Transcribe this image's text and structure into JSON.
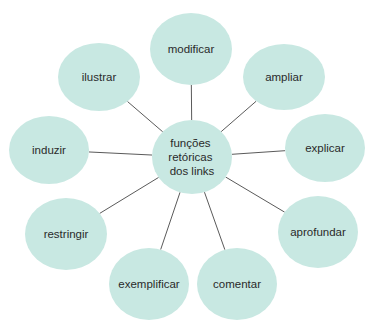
{
  "diagram": {
    "type": "radial-mind-map",
    "colors": {
      "bubble_fill": "#c8e8e2",
      "connector_line": "#5a5a5a",
      "text": "#2a2a2a",
      "background": "#ffffff"
    },
    "center": {
      "label_lines": [
        "funções",
        "retóricas",
        "dos links"
      ],
      "cx": 192,
      "cy": 157,
      "rx": 40,
      "ry": 37
    },
    "nodes": [
      {
        "label": "modificar",
        "cx": 191,
        "cy": 49,
        "rx": 41,
        "ry": 36
      },
      {
        "label": "ampliar",
        "cx": 284,
        "cy": 77,
        "rx": 41,
        "ry": 33
      },
      {
        "label": "explicar",
        "cx": 325,
        "cy": 148,
        "rx": 40,
        "ry": 34
      },
      {
        "label": "aprofundar",
        "cx": 318,
        "cy": 232,
        "rx": 40,
        "ry": 36
      },
      {
        "label": "comentar",
        "cx": 237,
        "cy": 284,
        "rx": 40,
        "ry": 36
      },
      {
        "label": "exemplificar",
        "cx": 149,
        "cy": 284,
        "rx": 40,
        "ry": 36
      },
      {
        "label": "restringir",
        "cx": 66,
        "cy": 234,
        "rx": 41,
        "ry": 36
      },
      {
        "label": "induzir",
        "cx": 49,
        "cy": 150,
        "rx": 40,
        "ry": 34
      },
      {
        "label": "ilustrar",
        "cx": 99,
        "cy": 77,
        "rx": 41,
        "ry": 34
      }
    ]
  }
}
